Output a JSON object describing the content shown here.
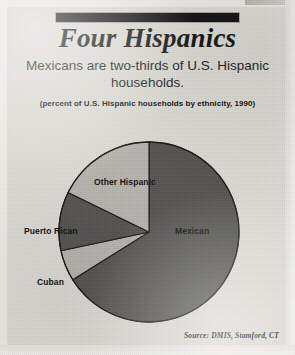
{
  "clipping": {
    "kicker_bar_text": "",
    "headline": "Four Hispanics",
    "deck": "Mexicans are two-thirds of U.S. Hispanic households.",
    "units_note": "(percent of  U.S. Hispanic households by ethnicity, 1990)",
    "source": "Source: DMIS, Stamford, CT"
  },
  "palette": {
    "paper": "#dcdad4",
    "ink": "#121212",
    "slice_dark": "#555450",
    "slice_light": "#b6b4ae",
    "slice_outline": "#1a1a1a"
  },
  "chart_data": {
    "type": "pie",
    "title": "Four Hispanics",
    "subtitle": "Mexicans are two-thirds of U.S. Hispanic households.",
    "units": "(percent of  U.S. Hispanic households by ethnicity, 1990)",
    "source": "Source: DMIS, Stamford, CT",
    "legend_position": "on-slice",
    "grid": false,
    "start_angle_deg": 0,
    "direction": "clockwise",
    "labels": [
      "Mexican",
      "Other Hispanic",
      "Puerto Rican",
      "Cuban"
    ],
    "values": [
      66,
      17,
      11,
      6
    ],
    "slices": [
      {
        "label": "Mexican",
        "value": 66,
        "color": "#555450",
        "start_deg": 0,
        "end_deg": 238
      },
      {
        "label": "Cuban",
        "value": 6,
        "color": "#b6b4ae",
        "start_deg": 238,
        "end_deg": 258
      },
      {
        "label": "Puerto Rican",
        "value": 11,
        "color": "#555450",
        "start_deg": 258,
        "end_deg": 296
      },
      {
        "label": "Other Hispanic",
        "value": 17,
        "color": "#b6b4ae",
        "start_deg": 296,
        "end_deg": 360
      }
    ],
    "geometry": {
      "cx": 149,
      "cy": 232,
      "r": 90
    }
  }
}
